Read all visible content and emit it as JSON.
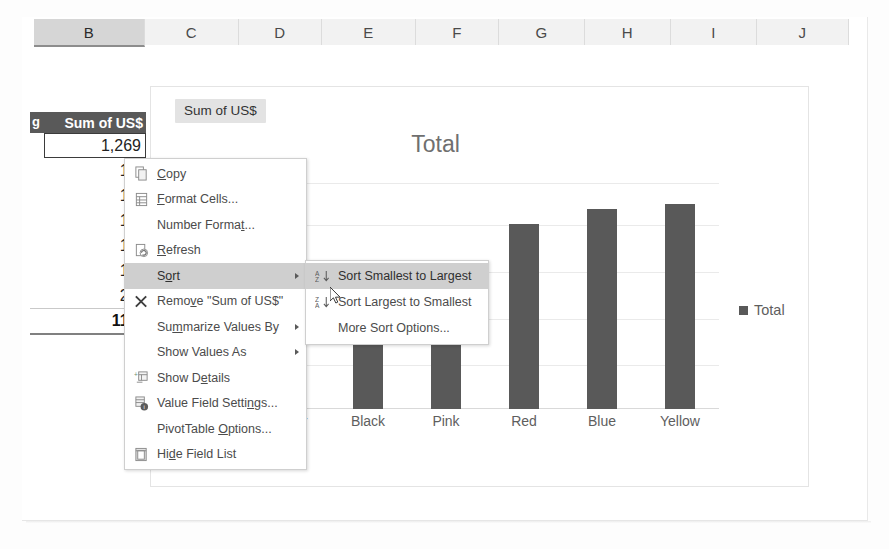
{
  "spreadsheet": {
    "columns": [
      {
        "label": "B",
        "width": 110,
        "selected": true
      },
      {
        "label": "C",
        "width": 93,
        "selected": false
      },
      {
        "label": "D",
        "width": 82,
        "selected": false
      },
      {
        "label": "E",
        "width": 93,
        "selected": false
      },
      {
        "label": "F",
        "width": 82,
        "selected": false
      },
      {
        "label": "G",
        "width": 85,
        "selected": false
      },
      {
        "label": "H",
        "width": 85,
        "selected": false
      },
      {
        "label": "I",
        "width": 85,
        "selected": false
      },
      {
        "label": "J",
        "width": 91,
        "selected": false
      }
    ]
  },
  "pivot_table": {
    "row_label_partial": "g",
    "value_header": "Sum of US$",
    "rows": [
      {
        "value": "1,269",
        "selected": true
      },
      {
        "value": "1,2",
        "selected": false
      },
      {
        "value": "1,4",
        "selected": false
      },
      {
        "value": "1,5",
        "selected": false
      },
      {
        "value": "1,8",
        "selected": false
      },
      {
        "value": "1,9",
        "selected": false
      },
      {
        "value": "2,0",
        "selected": false
      }
    ],
    "grand_total": "11,3"
  },
  "chart": {
    "field_button": "Sum of US$",
    "title": "Total",
    "legend": {
      "label": "Total",
      "color": "#595959",
      "position": "right"
    }
  },
  "chart_data": {
    "type": "bar",
    "title": "Total",
    "xlabel": "",
    "ylabel": "",
    "categories": [
      "Gold",
      "Silver",
      "Black",
      "Pink",
      "Red",
      "Blue",
      "Yellow"
    ],
    "values": [
      1269,
      1269,
      1269,
      1200,
      1800,
      1950,
      2000
    ],
    "series": [
      {
        "name": "Total",
        "color": "#595959",
        "values": [
          1269,
          1269,
          1269,
          1200,
          1800,
          1950,
          2000
        ]
      }
    ],
    "ylim": [
      0,
      2200
    ],
    "gridlines": true,
    "grid_count": 5,
    "legend_position": "right",
    "visible_categories": [
      "Silver",
      "Black",
      "Pink",
      "Red",
      "Blue",
      "Yellow"
    ],
    "note": "first category and left bars are obscured by the open context menu"
  },
  "context_menu": {
    "items": [
      {
        "label": "Copy",
        "icon": "copy-icon",
        "mnemonic": "C",
        "submenu": false,
        "highlighted": false
      },
      {
        "label": "Format Cells...",
        "icon": "format-cells-icon",
        "mnemonic": "F",
        "submenu": false,
        "highlighted": false
      },
      {
        "label": "Number Format...",
        "icon": "none",
        "mnemonic": "t",
        "submenu": false,
        "highlighted": false
      },
      {
        "label": "Refresh",
        "icon": "refresh-icon",
        "mnemonic": "R",
        "submenu": false,
        "highlighted": false
      },
      {
        "label": "Sort",
        "icon": "none",
        "mnemonic": "o",
        "submenu": true,
        "highlighted": true
      },
      {
        "label": "Remove \"Sum of US$\"",
        "icon": "remove-x-icon",
        "mnemonic": "v",
        "submenu": false,
        "highlighted": false
      },
      {
        "label": "Summarize Values By",
        "icon": "none",
        "mnemonic": "m",
        "submenu": true,
        "highlighted": false
      },
      {
        "label": "Show Values As",
        "icon": "none",
        "mnemonic": "",
        "submenu": true,
        "highlighted": false
      },
      {
        "label": "Show Details",
        "icon": "show-details-icon",
        "mnemonic": "e",
        "submenu": false,
        "highlighted": false
      },
      {
        "label": "Value Field Settings...",
        "icon": "value-field-settings-icon",
        "mnemonic": "n",
        "submenu": false,
        "highlighted": false
      },
      {
        "label": "PivotTable Options...",
        "icon": "none",
        "mnemonic": "O",
        "submenu": false,
        "highlighted": false
      },
      {
        "label": "Hide Field List",
        "icon": "hide-field-list-icon",
        "mnemonic": "d",
        "submenu": false,
        "highlighted": false
      }
    ]
  },
  "sort_submenu": {
    "items": [
      {
        "label": "Sort Smallest to Largest",
        "icon": "sort-asc-icon",
        "highlighted": true
      },
      {
        "label": "Sort Largest to Smallest",
        "icon": "sort-desc-icon",
        "highlighted": false
      },
      {
        "label": "More Sort Options...",
        "icon": "none",
        "highlighted": false
      }
    ]
  },
  "colors": {
    "bar": "#595959",
    "header_selected": "#d6d6d6",
    "menu_highlight": "#cfcfcf",
    "pivot_header_bg": "#595959"
  }
}
